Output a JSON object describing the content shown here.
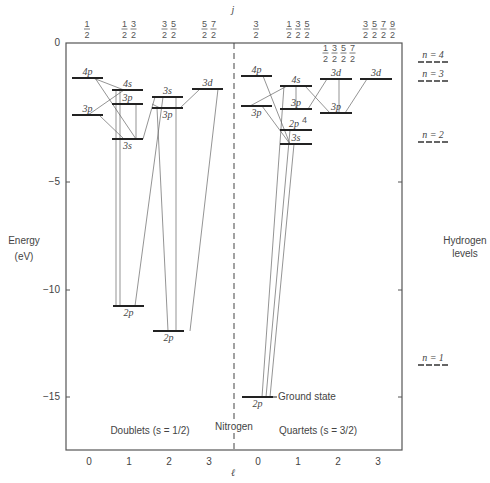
{
  "title": "Nitrogen",
  "axes": {
    "y_label_line1": "Energy",
    "y_label_line2": "(eV)",
    "y_ticks": [
      {
        "label": "0",
        "y": 43
      },
      {
        "label": "−5",
        "y": 182
      },
      {
        "label": "−10",
        "y": 290
      },
      {
        "label": "−15",
        "y": 397
      }
    ],
    "x_label": "ℓ",
    "j_label": "j",
    "x_ticks_left": [
      "0",
      "1",
      "2",
      "3"
    ],
    "x_ticks_right": [
      "0",
      "1",
      "2",
      "3"
    ]
  },
  "j_groups": {
    "left": [
      {
        "x": 87,
        "fracs": [
          "1/2"
        ]
      },
      {
        "x": 129,
        "fracs": [
          "1/2",
          "3/2"
        ]
      },
      {
        "x": 169,
        "fracs": [
          "3/2",
          "5/2"
        ]
      },
      {
        "x": 209,
        "fracs": [
          "5/2",
          "7/2"
        ]
      }
    ],
    "right": [
      {
        "x": 256,
        "fracs": [
          "3/2"
        ]
      },
      {
        "x": 298,
        "fracs": [
          "1/2",
          "3/2",
          "5/2"
        ]
      },
      {
        "x": 339,
        "fracs": [
          "1/2",
          "3/2",
          "5/2",
          "7/2"
        ],
        "inside": true
      },
      {
        "x": 379,
        "fracs": [
          "3/2",
          "5/2",
          "7/2",
          "9/2"
        ]
      }
    ]
  },
  "sections": {
    "doublets": "Doublets (s = 1/2)",
    "quartets": "Quartets (s = 3/2)",
    "nitrogen": "Nitrogen"
  },
  "hydrogen": {
    "label_line1": "Hydrogen",
    "label_line2": "levels",
    "levels": [
      {
        "n": "n = 4",
        "y": 62
      },
      {
        "n": "n = 3",
        "y": 81
      },
      {
        "n": "n = 2",
        "y": 142
      },
      {
        "n": "n = 1",
        "y": 365
      }
    ]
  },
  "levels": {
    "doublets": [
      {
        "name": "4p",
        "x1": 72,
        "x2": 103,
        "y": 78,
        "label_pos": "above"
      },
      {
        "name": "3p",
        "x1": 72,
        "x2": 103,
        "y": 115,
        "label_pos": "above"
      },
      {
        "name": "4s",
        "x1": 112,
        "x2": 143,
        "y": 90,
        "label_pos": "above"
      },
      {
        "name": "3p",
        "x1": 112,
        "x2": 143,
        "y": 104,
        "label_pos": "above"
      },
      {
        "name": "3s",
        "x1": 112,
        "x2": 143,
        "y": 139,
        "label_pos": "below"
      },
      {
        "name": "2p",
        "x1": 113,
        "x2": 144,
        "y": 306,
        "label_pos": "below"
      },
      {
        "name": "3s",
        "x1": 152,
        "x2": 183,
        "y": 97,
        "label_pos": "above"
      },
      {
        "name": "3p",
        "x1": 152,
        "x2": 183,
        "y": 108,
        "label_pos": "below"
      },
      {
        "name": "2p",
        "x1": 153,
        "x2": 184,
        "y": 331,
        "label_pos": "below"
      },
      {
        "name": "3d",
        "x1": 192,
        "x2": 223,
        "y": 89,
        "label_pos": "above"
      }
    ],
    "quartets": [
      {
        "name": "4p",
        "x1": 241,
        "x2": 272,
        "y": 76,
        "label_pos": "above"
      },
      {
        "name": "3p",
        "x1": 241,
        "x2": 272,
        "y": 106,
        "label_pos": "below"
      },
      {
        "name": "4s",
        "x1": 280,
        "x2": 312,
        "y": 86,
        "label_pos": "above"
      },
      {
        "name": "3p",
        "x1": 280,
        "x2": 312,
        "y": 109,
        "label_pos": "above"
      },
      {
        "name": "2p4",
        "x1": 280,
        "x2": 312,
        "y": 130,
        "label_pos": "above"
      },
      {
        "name": "3s",
        "x1": 280,
        "x2": 312,
        "y": 144,
        "label_pos": "above"
      },
      {
        "name": "3d",
        "x1": 320,
        "x2": 352,
        "y": 79,
        "label_pos": "above"
      },
      {
        "name": "3p",
        "x1": 320,
        "x2": 352,
        "y": 113,
        "label_pos": "above"
      },
      {
        "name": "3d",
        "x1": 360,
        "x2": 392,
        "y": 79,
        "label_pos": "above"
      },
      {
        "name": "2p",
        "x1": 242,
        "x2": 273,
        "y": 397,
        "label_pos": "below",
        "note": "Ground state"
      }
    ]
  },
  "transitions": [
    [
      93,
      78,
      124,
      90
    ],
    [
      95,
      78,
      136,
      139
    ],
    [
      88,
      115,
      124,
      90
    ],
    [
      99,
      115,
      124,
      139
    ],
    [
      116,
      90,
      116,
      306
    ],
    [
      120,
      90,
      120,
      306
    ],
    [
      136,
      104,
      136,
      139
    ],
    [
      143,
      139,
      155,
      97
    ],
    [
      152,
      104,
      160,
      108
    ],
    [
      163,
      97,
      135,
      306
    ],
    [
      176,
      97,
      176,
      331
    ],
    [
      157,
      108,
      168,
      331
    ],
    [
      200,
      89,
      180,
      108
    ],
    [
      218,
      89,
      190,
      331
    ],
    [
      263,
      76,
      290,
      144
    ],
    [
      250,
      106,
      287,
      86
    ],
    [
      262,
      106,
      290,
      144
    ],
    [
      284,
      86,
      262,
      397
    ],
    [
      296,
      86,
      296,
      109
    ],
    [
      290,
      130,
      266,
      397
    ],
    [
      294,
      144,
      270,
      397
    ],
    [
      308,
      109,
      327,
      79
    ],
    [
      305,
      86,
      330,
      113
    ],
    [
      339,
      79,
      339,
      113
    ],
    [
      367,
      79,
      345,
      113
    ]
  ]
}
